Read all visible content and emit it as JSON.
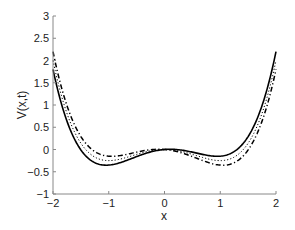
{
  "chart_data": {
    "type": "line",
    "title": "",
    "xlabel": "x",
    "ylabel": "V(x,t)",
    "xlim": [
      -2,
      2
    ],
    "ylim": [
      -1,
      3
    ],
    "xticks": [
      -2,
      -1,
      0,
      1,
      2
    ],
    "yticks": [
      -1,
      -0.5,
      0,
      0.5,
      1,
      1.5,
      2,
      2.5,
      3
    ],
    "grid": false,
    "legend": null,
    "model": "V(x) = 0.25*(x^4 - 2x^2) + b*x",
    "series": [
      {
        "name": "solid",
        "style": "solid",
        "tilt_b": 0.1,
        "x": [
          -2,
          -1.5,
          -1,
          -0.5,
          0,
          0.5,
          1,
          1.5,
          2
        ],
        "values": [
          1.8,
          0.0656,
          -0.35,
          -0.1344,
          0,
          -0.0594,
          -0.15,
          0.3656,
          2.2
        ]
      },
      {
        "name": "dotted",
        "style": "dotted",
        "tilt_b": 0.0,
        "x": [
          -2,
          -1.5,
          -1,
          -0.5,
          0,
          0.5,
          1,
          1.5,
          2
        ],
        "values": [
          2.0,
          0.2156,
          -0.25,
          -0.1094,
          0,
          -0.1094,
          -0.25,
          0.2156,
          2.0
        ]
      },
      {
        "name": "dash-dot",
        "style": "dashdot",
        "tilt_b": -0.1,
        "x": [
          -2,
          -1.5,
          -1,
          -0.5,
          0,
          0.5,
          1,
          1.5,
          2
        ],
        "values": [
          2.2,
          0.3656,
          -0.15,
          -0.0594,
          0,
          -0.1344,
          -0.35,
          0.0656,
          1.8
        ]
      }
    ]
  },
  "colors": {
    "axis": "#888888",
    "curve": "#000000",
    "text": "#222222"
  },
  "layout": {
    "plot_left": 53,
    "plot_right": 276,
    "plot_top": 16,
    "plot_bottom": 194
  }
}
